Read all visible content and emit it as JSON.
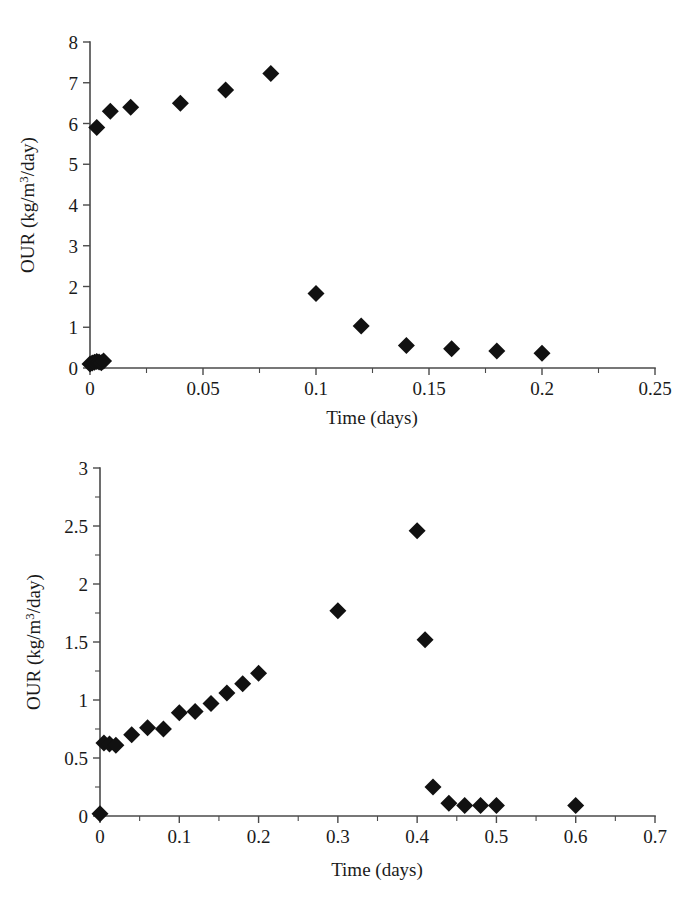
{
  "page": {
    "background_color": "#ffffff",
    "marker_color": "#111111",
    "axis_color": "#4a4a4a"
  },
  "chart_data": [
    {
      "id": "top",
      "type": "scatter",
      "title": "",
      "subtitle": "",
      "xlabel": "Time (days)",
      "ylabel": "OUR (kg/m3/day)",
      "ylabel_parts": {
        "prefix": "OUR (kg/m",
        "superscript": "3",
        "suffix": "/day)"
      },
      "xlim": [
        0,
        0.25
      ],
      "ylim": [
        0,
        8
      ],
      "xticks": [
        0,
        0.05,
        0.1,
        0.15,
        0.2,
        0.25
      ],
      "xticklabels": [
        "0",
        "0.05",
        "0.1",
        "0.15",
        "0.2",
        "0.25"
      ],
      "xminorticks": [
        0.025,
        0.075,
        0.125,
        0.175,
        0.225
      ],
      "yticks": [
        0,
        1,
        2,
        3,
        4,
        5,
        6,
        7,
        8
      ],
      "yticklabels": [
        "0",
        "1",
        "2",
        "3",
        "4",
        "5",
        "6",
        "7",
        "8"
      ],
      "grid": false,
      "legend": false,
      "marker": "diamond",
      "series": [
        {
          "name": "OUR",
          "points": [
            [
              0.0,
              0.1
            ],
            [
              0.001,
              0.12
            ],
            [
              0.002,
              0.14
            ],
            [
              0.003,
              0.16
            ],
            [
              0.004,
              0.15
            ],
            [
              0.005,
              0.13
            ],
            [
              0.006,
              0.17
            ],
            [
              0.003,
              5.9
            ],
            [
              0.009,
              6.3
            ],
            [
              0.018,
              6.4
            ],
            [
              0.04,
              6.5
            ],
            [
              0.06,
              6.82
            ],
            [
              0.08,
              7.23
            ],
            [
              0.1,
              1.83
            ],
            [
              0.12,
              1.03
            ],
            [
              0.14,
              0.55
            ],
            [
              0.16,
              0.47
            ],
            [
              0.18,
              0.42
            ],
            [
              0.2,
              0.36
            ]
          ]
        }
      ]
    },
    {
      "id": "bottom",
      "type": "scatter",
      "title": "",
      "subtitle": "",
      "xlabel": "Time (days)",
      "ylabel": "OUR (kg/m3/day)",
      "ylabel_parts": {
        "prefix": "OUR (kg/m",
        "superscript": "3",
        "suffix": "/day)"
      },
      "xlim": [
        0,
        0.7
      ],
      "ylim": [
        0,
        3
      ],
      "xticks": [
        0,
        0.1,
        0.2,
        0.3,
        0.4,
        0.5,
        0.6,
        0.7
      ],
      "xticklabels": [
        "0",
        "0.1",
        "0.2",
        "0.3",
        "0.4",
        "0.5",
        "0.6",
        "0.7"
      ],
      "xminorticks": [
        0.05,
        0.15,
        0.25,
        0.35,
        0.45,
        0.55,
        0.65
      ],
      "yticks": [
        0,
        0.5,
        1,
        1.5,
        2,
        2.5,
        3
      ],
      "yticklabels": [
        "0",
        "0.5",
        "1",
        "1.5",
        "2",
        "2.5",
        "3"
      ],
      "yminorticks": [
        0.25,
        0.75,
        1.25,
        1.75,
        2.25,
        2.75
      ],
      "grid": false,
      "legend": false,
      "marker": "diamond",
      "series": [
        {
          "name": "OUR",
          "points": [
            [
              0.0,
              0.02
            ],
            [
              0.005,
              0.63
            ],
            [
              0.012,
              0.62
            ],
            [
              0.02,
              0.61
            ],
            [
              0.04,
              0.7
            ],
            [
              0.06,
              0.76
            ],
            [
              0.08,
              0.75
            ],
            [
              0.1,
              0.89
            ],
            [
              0.12,
              0.9
            ],
            [
              0.14,
              0.97
            ],
            [
              0.16,
              1.06
            ],
            [
              0.18,
              1.14
            ],
            [
              0.2,
              1.23
            ],
            [
              0.3,
              1.77
            ],
            [
              0.4,
              2.46
            ],
            [
              0.41,
              1.52
            ],
            [
              0.42,
              0.25
            ],
            [
              0.44,
              0.11
            ],
            [
              0.46,
              0.09
            ],
            [
              0.48,
              0.09
            ],
            [
              0.5,
              0.09
            ],
            [
              0.6,
              0.09
            ]
          ]
        }
      ]
    }
  ]
}
